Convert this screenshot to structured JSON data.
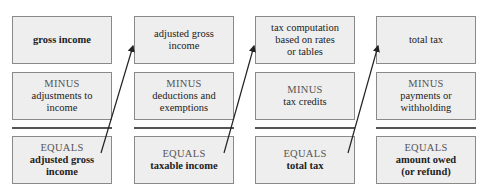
{
  "diagram": {
    "columns": [
      {
        "top": {
          "lines": [
            "gross income"
          ],
          "bold": true
        },
        "minus": {
          "keyword": "MINUS",
          "lines": [
            "adjustments to",
            "income"
          ]
        },
        "equals": {
          "keyword": "EQUALS",
          "lines": [
            "adjusted gross",
            "income"
          ]
        }
      },
      {
        "top": {
          "lines": [
            "adjusted gross",
            "income"
          ],
          "bold": false
        },
        "minus": {
          "keyword": "MINUS",
          "lines": [
            "deductions and",
            "exemptions"
          ]
        },
        "equals": {
          "keyword": "EQUALS",
          "lines": [
            "taxable income"
          ]
        }
      },
      {
        "top": {
          "lines": [
            "tax computation",
            "based on rates",
            "or tables"
          ],
          "bold": false
        },
        "minus": {
          "keyword": "MINUS",
          "lines": [
            "tax credits"
          ]
        },
        "equals": {
          "keyword": "EQUALS",
          "lines": [
            "total tax"
          ]
        }
      },
      {
        "top": {
          "lines": [
            "total tax"
          ],
          "bold": false
        },
        "minus": {
          "keyword": "MINUS",
          "lines": [
            "payments or",
            "withholding"
          ]
        },
        "equals": {
          "keyword": "EQUALS",
          "lines": [
            "amount owed",
            "(or refund)"
          ]
        }
      }
    ],
    "arrows": [
      {
        "from": "column-1-equals",
        "to": "column-2-top"
      },
      {
        "from": "column-2-equals",
        "to": "column-3-top"
      },
      {
        "from": "column-3-equals",
        "to": "column-4-top"
      }
    ],
    "colors": {
      "box_fill": "#eeeeee",
      "box_border": "#8a8a8a",
      "keyword": "#555555",
      "rule": "#555555",
      "arrow": "#222222"
    }
  }
}
